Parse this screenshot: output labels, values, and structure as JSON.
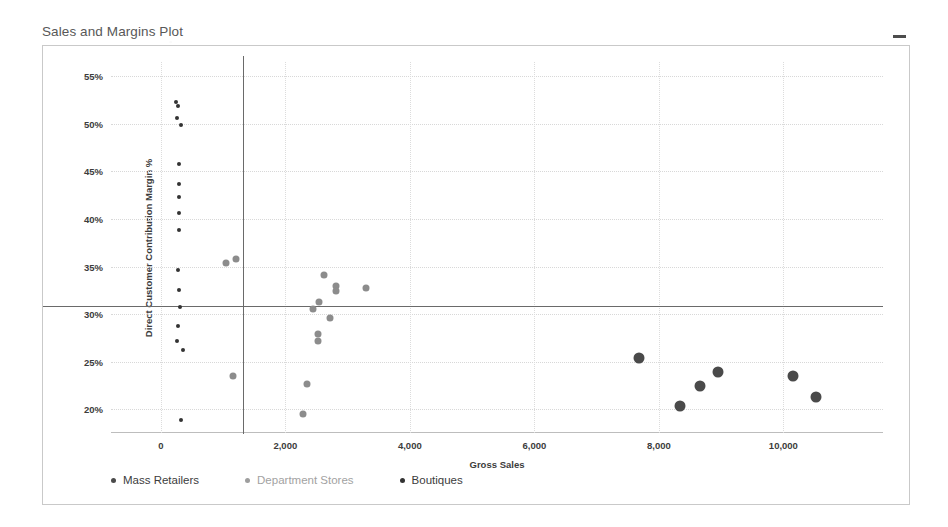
{
  "window": {
    "title": "Sales and Margins Plot",
    "minimize_icon": "minimize-icon",
    "minimize_glyph": "–"
  },
  "colors": {
    "mass_retailers": "#4a4a4a",
    "department_stores": "#8c8c8c",
    "boutiques": "#333333",
    "reference_line": "#6a6a6a",
    "gridline": "#d8d8d8",
    "frame": "#c9c9c9",
    "title_text": "#585858",
    "axis_text": "#3c3c3c"
  },
  "legend": {
    "position": "bottom-left",
    "items": [
      {
        "label": "Mass Retailers",
        "color": "#4a4a4a"
      },
      {
        "label": "Department Stores",
        "color": "#9e9e9e"
      },
      {
        "label": "Boutiques",
        "color": "#333333"
      }
    ]
  },
  "chart_data": {
    "type": "scatter",
    "title": "Sales and Margins Plot",
    "xlabel": "Gross Sales",
    "ylabel": "Direct Customer Contribution Margin %",
    "xlim": [
      -800,
      11600
    ],
    "ylim": [
      17.5,
      56.5
    ],
    "xticks": [
      0,
      2000,
      4000,
      6000,
      8000,
      10000
    ],
    "xticklabels": [
      "0",
      "2,000",
      "4,000",
      "6,000",
      "8,000",
      "10,000"
    ],
    "yticks": [
      20,
      25,
      30,
      35,
      40,
      45,
      50,
      55
    ],
    "yticklabels": [
      "20%",
      "25%",
      "30%",
      "35%",
      "40%",
      "45%",
      "50%",
      "55%"
    ],
    "grid": true,
    "legend_position": "bottom-left",
    "reference_lines": {
      "vertical_x": 1320,
      "horizontal_y": 30.9
    },
    "series": [
      {
        "name": "Boutiques",
        "color": "#333333",
        "marker_size": 4,
        "points": [
          {
            "x": 250,
            "y": 52.3
          },
          {
            "x": 280,
            "y": 51.9
          },
          {
            "x": 255,
            "y": 50.6
          },
          {
            "x": 330,
            "y": 49.9
          },
          {
            "x": 300,
            "y": 45.8
          },
          {
            "x": 300,
            "y": 43.7
          },
          {
            "x": 295,
            "y": 42.3
          },
          {
            "x": 300,
            "y": 40.6
          },
          {
            "x": 300,
            "y": 38.8
          },
          {
            "x": 280,
            "y": 34.6
          },
          {
            "x": 290,
            "y": 32.5
          },
          {
            "x": 310,
            "y": 30.7
          },
          {
            "x": 270,
            "y": 28.8
          },
          {
            "x": 265,
            "y": 27.2
          },
          {
            "x": 350,
            "y": 26.2
          },
          {
            "x": 330,
            "y": 18.9
          }
        ]
      },
      {
        "name": "Department Stores",
        "color": "#8c8c8c",
        "marker_size": 7,
        "points": [
          {
            "x": 1050,
            "y": 35.4
          },
          {
            "x": 1200,
            "y": 35.8
          },
          {
            "x": 2620,
            "y": 34.1
          },
          {
            "x": 2810,
            "y": 33.0
          },
          {
            "x": 2820,
            "y": 32.4
          },
          {
            "x": 3300,
            "y": 32.7
          },
          {
            "x": 2540,
            "y": 31.3
          },
          {
            "x": 2450,
            "y": 30.5
          },
          {
            "x": 2720,
            "y": 29.6
          },
          {
            "x": 2530,
            "y": 27.9
          },
          {
            "x": 2520,
            "y": 27.2
          },
          {
            "x": 2350,
            "y": 22.6
          },
          {
            "x": 1160,
            "y": 23.5
          },
          {
            "x": 2280,
            "y": 19.5
          }
        ]
      },
      {
        "name": "Mass Retailers",
        "color": "#4a4a4a",
        "marker_size": 11,
        "points": [
          {
            "x": 7680,
            "y": 25.4
          },
          {
            "x": 8340,
            "y": 20.3
          },
          {
            "x": 8660,
            "y": 22.4
          },
          {
            "x": 8950,
            "y": 23.9
          },
          {
            "x": 10150,
            "y": 23.5
          },
          {
            "x": 10520,
            "y": 21.3
          }
        ]
      }
    ]
  }
}
